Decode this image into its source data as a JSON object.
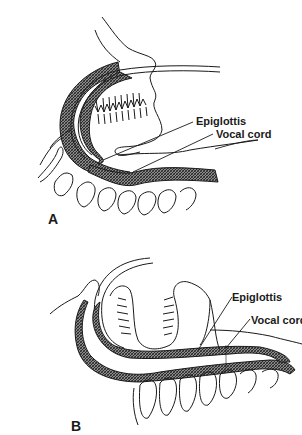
{
  "figure": {
    "panels": [
      {
        "id": "A",
        "label": "A",
        "annotations": [
          {
            "text": "Epiglottis"
          },
          {
            "text": "Vocal cord"
          }
        ]
      },
      {
        "id": "B",
        "label": "B",
        "annotations": [
          {
            "text": "Epiglottis"
          },
          {
            "text": "Vocal cord"
          }
        ]
      }
    ],
    "colors": {
      "line": "#1a1a1a",
      "hatch": "#555555",
      "background": "#ffffff"
    }
  }
}
